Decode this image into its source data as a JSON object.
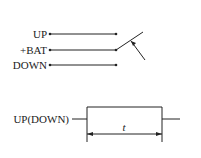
{
  "switch_diagram": {
    "terminals": [
      {
        "label": "UP"
      },
      {
        "label": "+BAT"
      },
      {
        "label": "DOWN"
      }
    ]
  },
  "timing_diagram": {
    "signal_label": "UP(DOWN)",
    "duration_label": "t"
  },
  "colors": {
    "line": "#222222",
    "background": "#ffffff"
  }
}
